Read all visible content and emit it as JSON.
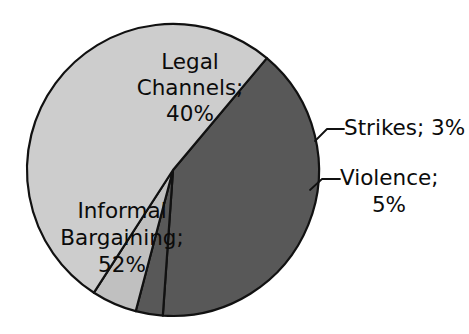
{
  "chart_data": {
    "type": "pie",
    "title": "",
    "subtitle": "",
    "xlabel": "",
    "ylabel": "",
    "legend_position": "none",
    "grid": false,
    "units": "percent",
    "total": 100,
    "categories": [
      "Legal Channels",
      "Strikes",
      "Violence",
      "Informal Bargaining"
    ],
    "values": [
      40,
      3,
      5,
      52
    ],
    "colors": [
      "#585858",
      "#585858",
      "#c0c0c0",
      "#cdcdcd"
    ],
    "slices": [
      {
        "name": "Legal Channels",
        "value": 40,
        "value_text": "40%",
        "label": "Legal Channels;",
        "label_full": "Legal Channels; 40%",
        "color": "#585858",
        "label_placement": "inside",
        "label_lines": [
          "Legal",
          "Channels;",
          "40%"
        ]
      },
      {
        "name": "Strikes",
        "value": 3,
        "value_text": "3%",
        "label": "Strikes;",
        "label_full": "Strikes; 3%",
        "color": "#585858",
        "label_placement": "outside",
        "label_lines": [
          "Strikes; 3%"
        ]
      },
      {
        "name": "Violence",
        "value": 5,
        "value_text": "5%",
        "label": "Violence;",
        "label_full": "Violence; 5%",
        "color": "#c0c0c0",
        "label_placement": "outside",
        "label_lines": [
          "Violence;",
          "5%"
        ]
      },
      {
        "name": "Informal Bargaining",
        "value": 52,
        "value_text": "52%",
        "label": "Informal Bargaining;",
        "label_full": "Informal Bargaining; 52%",
        "color": "#cdcdcd",
        "label_placement": "inside",
        "label_lines": [
          "Informal",
          "Bargaining;",
          "52%"
        ]
      }
    ]
  },
  "labels": {
    "legal_line1": "Legal",
    "legal_line2": "Channels;",
    "legal_line3": "40%",
    "informal_line1": "Informal",
    "informal_line2": "Bargaining;",
    "informal_line3": "52%",
    "strikes_line1": "Strikes; 3%",
    "violence_line1": "Violence;",
    "violence_line2": "5%"
  },
  "style": {
    "background": "#ffffff",
    "outline": "#111111",
    "text": "#0b0b0b",
    "dark_slice": "#585858",
    "light_slice": "#cdcdcd",
    "mid_slice": "#c0c0c0"
  },
  "geometry": {
    "center_x": 173,
    "center_y": 170,
    "radius": 146
  }
}
